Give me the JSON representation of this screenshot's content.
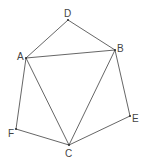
{
  "diagram": {
    "type": "geometry-figure",
    "points": {
      "A": {
        "label": "A",
        "x": 26,
        "y": 58,
        "label_x": 17,
        "label_y": 60
      },
      "B": {
        "label": "B",
        "x": 115,
        "y": 50,
        "label_x": 117,
        "label_y": 52
      },
      "C": {
        "label": "C",
        "x": 69,
        "y": 145,
        "label_x": 65,
        "label_y": 157
      },
      "D": {
        "label": "D",
        "x": 68,
        "y": 20,
        "label_x": 64,
        "label_y": 17
      },
      "E": {
        "label": "E",
        "x": 130,
        "y": 116,
        "label_x": 132,
        "label_y": 122
      },
      "F": {
        "label": "F",
        "x": 16,
        "y": 129,
        "label_x": 8,
        "label_y": 137
      }
    },
    "edges": [
      [
        "A",
        "D"
      ],
      [
        "D",
        "B"
      ],
      [
        "A",
        "B"
      ],
      [
        "A",
        "C"
      ],
      [
        "B",
        "C"
      ],
      [
        "B",
        "E"
      ],
      [
        "E",
        "C"
      ],
      [
        "A",
        "F"
      ],
      [
        "F",
        "C"
      ]
    ],
    "colors": {
      "line": "#555555",
      "text": "#444444",
      "background": "#ffffff"
    }
  }
}
